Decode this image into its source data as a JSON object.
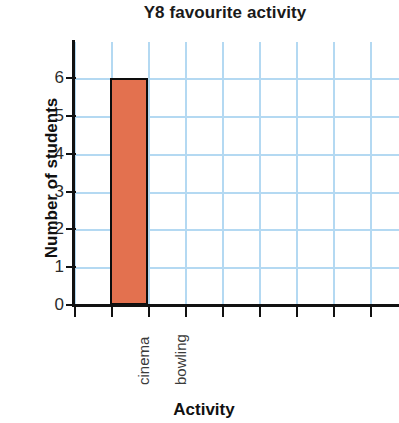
{
  "chart_data": {
    "type": "bar",
    "title": "Y8 favourite activity",
    "xlabel": "Activity",
    "ylabel": "Number of students",
    "categories": [
      "cinema",
      "bowling"
    ],
    "values": [
      6,
      0
    ],
    "ytick_labels": [
      "0",
      "1",
      "2",
      "3",
      "4",
      "5",
      "6"
    ],
    "ylim": [
      0,
      7
    ],
    "grid": true,
    "grid_color": "#b4d9f2",
    "bar_color": "#e3714f",
    "bar_edge_color": "#0d0d0d",
    "axis_color": "#111111",
    "legend": null
  }
}
